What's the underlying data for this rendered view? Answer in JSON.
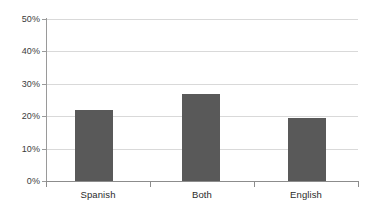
{
  "chart_data": {
    "type": "bar",
    "title": "",
    "subtitle": "",
    "xlabel": "",
    "ylabel": "",
    "categories": [
      "Spanish",
      "Both",
      "English"
    ],
    "values": [
      22,
      27,
      19.5
    ],
    "value_labels": [
      "22%",
      "27%",
      "19.5%"
    ],
    "ylim": [
      0,
      50
    ],
    "ytick_values": [
      0,
      10,
      20,
      30,
      40,
      50
    ],
    "ytick_labels": [
      "0%",
      "10%",
      "20%",
      "30%",
      "40%",
      "50%"
    ],
    "ytick_format": "percent",
    "grid": true,
    "grid_axis": "y",
    "legend": false,
    "legend_position": "none",
    "series": [
      {
        "name": "Share",
        "values": [
          22,
          27,
          19.5
        ]
      }
    ],
    "annotations": []
  },
  "style": {
    "background_color": "#ffffff",
    "bar_color": "#595959",
    "gridline_color": "#d9d9d9",
    "axis_color": "#8c8c8c",
    "tick_label_color": "#3b3b3b",
    "category_label_color": "#2b2b2b"
  },
  "axis": {
    "y_labels": [
      "50%",
      "40%",
      "30%",
      "20%",
      "10%",
      "0%"
    ],
    "x_labels": [
      "Spanish",
      "Both",
      "English"
    ]
  }
}
